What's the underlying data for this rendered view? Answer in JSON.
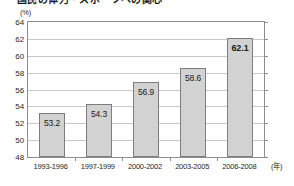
{
  "title": "国民の体力・スポーツへの関心",
  "chart_data": {
    "type": "bar",
    "title": "国民の体力・スポーツへの関心",
    "xlabel": "(年)",
    "ylabel": "(%)",
    "categories": [
      "1993-1996",
      "1997-1999",
      "2000-2002",
      "2003-2005",
      "2006-2008"
    ],
    "values": [
      53.2,
      54.3,
      56.9,
      58.6,
      62.1
    ],
    "value_labels": [
      "53.2",
      "54.3",
      "56.9",
      "58.6",
      "62.1"
    ],
    "emphasized_index": 4,
    "ylim": [
      48,
      64
    ],
    "yticks": [
      48,
      50,
      52,
      54,
      56,
      58,
      60,
      62,
      64
    ],
    "ytick_labels": [
      "48",
      "50",
      "52",
      "54",
      "56",
      "58",
      "60",
      "62",
      "64"
    ],
    "grid": true,
    "legend": false,
    "bar_color": "#d2d2d2",
    "bar_border_color": "#7d7d7d",
    "grid_color": "#c9c9c9",
    "axis_color": "#8d8d8d"
  }
}
